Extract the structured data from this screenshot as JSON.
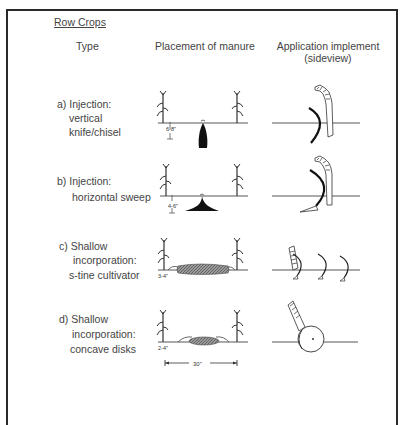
{
  "title": "Row Crops",
  "headers": {
    "type": "Type",
    "placement": "Placement of manure",
    "implement_line1": "Application implement",
    "implement_line2": "(sideview)"
  },
  "rows": [
    {
      "label_line1": "a) Injection:",
      "label_line2": "vertical",
      "label_line3": "knife/chisel",
      "depth": "6-8\"",
      "implement": "vertical knife/chisel"
    },
    {
      "label_line1": "b) Injection:",
      "label_line2": "horizontal sweep",
      "depth": "4-6\"",
      "implement": "horizontal sweep"
    },
    {
      "label_line1": "c) Shallow",
      "label_line2": "incorporation:",
      "label_line3": "s-tine cultivator",
      "depth": "3-4\"",
      "implement": "s-tine cultivator"
    },
    {
      "label_line1": "d) Shallow",
      "label_line2": "incorporation:",
      "label_line3": "concave disks",
      "depth": "2-4\"",
      "implement": "concave disks"
    }
  ],
  "row_spacing": "30\""
}
